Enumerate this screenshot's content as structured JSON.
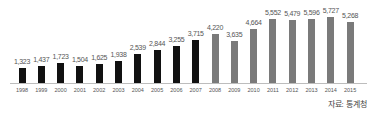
{
  "chart_data": {
    "type": "bar",
    "title": "",
    "xlabel": "",
    "ylabel": "",
    "categories": [
      "1998",
      "1999",
      "2000",
      "2001",
      "2002",
      "2003",
      "2004",
      "2005",
      "2006",
      "2007",
      "2008",
      "2009",
      "2010",
      "2011",
      "2012",
      "2013",
      "2014",
      "2015"
    ],
    "values": [
      1323,
      1437,
      1723,
      1504,
      1625,
      1938,
      2539,
      2844,
      3255,
      3715,
      4220,
      3635,
      4664,
      5552,
      5479,
      5596,
      5727,
      5268
    ],
    "value_labels": [
      "1,323",
      "1,437",
      "1,723",
      "1,504",
      "1,625",
      "1,938",
      "2,539",
      "2,844",
      "3,255",
      "3,715",
      "4,220",
      "3,635",
      "4,664",
      "5,552",
      "5,479",
      "5,596",
      "5,727",
      "5,268"
    ],
    "bar_colors": [
      "#111111",
      "#111111",
      "#111111",
      "#111111",
      "#111111",
      "#111111",
      "#111111",
      "#111111",
      "#111111",
      "#111111",
      "#7a7a7a",
      "#7a7a7a",
      "#7a7a7a",
      "#7a7a7a",
      "#7a7a7a",
      "#7a7a7a",
      "#7a7a7a",
      "#7a7a7a"
    ],
    "grid": false,
    "legend": null,
    "ylim": [
      0,
      6000
    ],
    "source": "자료: 통계청"
  },
  "colors": {
    "dark_bar": "#111111",
    "gray_bar": "#7a7a7a",
    "axis": "#bdbdbd",
    "text": "#555555"
  }
}
